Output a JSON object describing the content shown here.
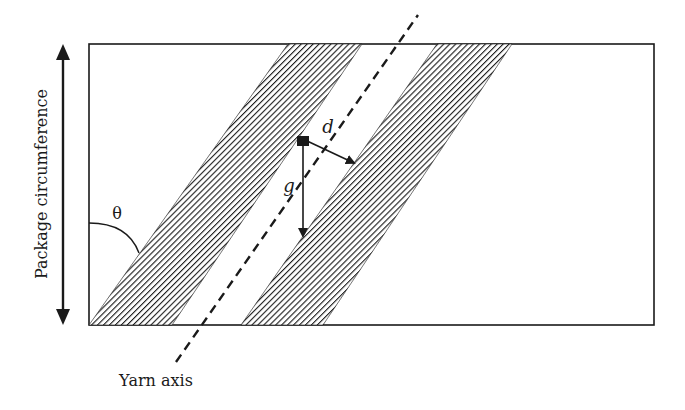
{
  "figure": {
    "labels": {
      "vertical_axis": "Package circumference",
      "yarn_axis": "Yarn axis",
      "angle": "θ",
      "spacing_d": "d",
      "gap_g": "g"
    },
    "colors": {
      "stroke": "#1a1a1a",
      "background": "#ffffff",
      "hatch": "#1a1a1a"
    },
    "elements": {
      "package_rectangle": {
        "x": 89,
        "y": 44,
        "width": 565,
        "height": 281
      },
      "ribbon_bands": [
        {
          "bottom_left": 89,
          "bottom_right": 172,
          "top_left": 288,
          "top_right": 362
        },
        {
          "bottom_left": 241,
          "bottom_right": 323,
          "top_left": 437,
          "top_right": 512
        }
      ],
      "yarn_axis_line": {
        "x1": 176,
        "y1": 362,
        "x2": 418,
        "y2": 15,
        "style": "dashed"
      }
    }
  }
}
